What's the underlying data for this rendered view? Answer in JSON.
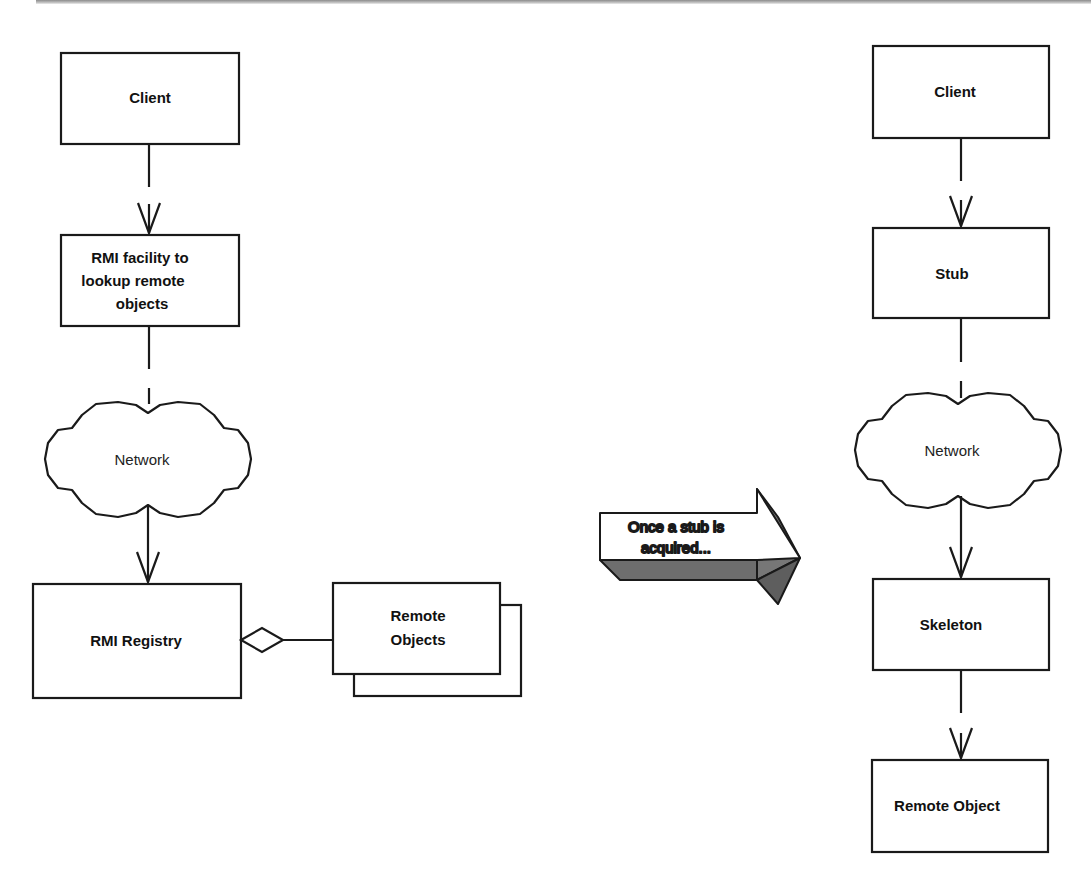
{
  "left_flow": {
    "client": "Client",
    "lookup": [
      "RMI facility to",
      "lookup remote",
      "objects"
    ],
    "network": "Network",
    "registry": "RMI Registry",
    "remote_objects": [
      "Remote",
      "Objects"
    ]
  },
  "transition": {
    "lines": [
      "Once a stub is",
      "acquired..."
    ]
  },
  "right_flow": {
    "client": "Client",
    "stub": "Stub",
    "network": "Network",
    "skeleton": "Skeleton",
    "remote_object": "Remote Object"
  },
  "colors": {
    "stroke": "#1a1a1a",
    "arrow_shade": "#6e6e6e"
  }
}
